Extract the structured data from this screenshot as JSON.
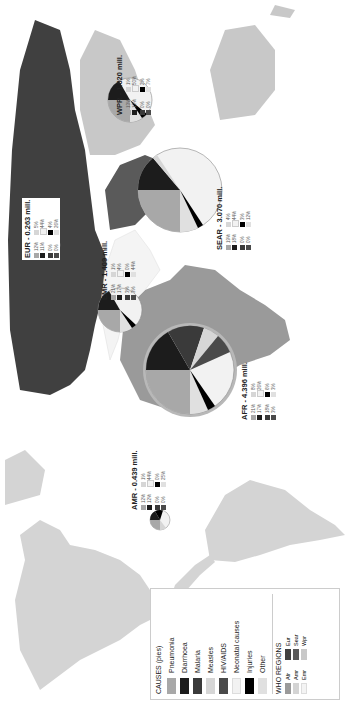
{
  "map": {
    "title": "WHO regions - causes of child deaths (pies)",
    "caption": "Distribution of deaths among children under five by cause and WHO region"
  },
  "colors": {
    "pneumonia": "#a8a8a8",
    "diarrhoea": "#1c1c1c",
    "malaria": "#3a3a3a",
    "measles": "#d6d6d6",
    "hiv_aids": "#4a4a4a",
    "neonatal": "#f2f2f2",
    "injuries": "#000000",
    "other": "#e0e0e0",
    "region_afr": "#9a9a9a",
    "region_amr": "#d4d4d4",
    "region_emr": "#f4f4f4",
    "region_eur": "#404040",
    "region_sear": "#5a5a5a",
    "region_wpr": "#c8c8c8"
  },
  "legend": {
    "causes_title": "CAUSES (pies)",
    "causes": [
      {
        "label": "Pneumonia",
        "key": "pneumonia"
      },
      {
        "label": "Diarrhoea",
        "key": "diarrhoea"
      },
      {
        "label": "Malaria",
        "key": "malaria"
      },
      {
        "label": "Measles",
        "key": "measles"
      },
      {
        "label": "HIV/AIDS",
        "key": "hiv_aids"
      },
      {
        "label": "Neonatal causes",
        "key": "neonatal"
      },
      {
        "label": "Injuries",
        "key": "injuries"
      },
      {
        "label": "Other",
        "key": "other"
      }
    ],
    "regions_title": "WHO REGIONS",
    "regions": [
      {
        "label": "Afr",
        "key": "region_afr"
      },
      {
        "label": "Eur",
        "key": "region_eur"
      },
      {
        "label": "Amr",
        "key": "region_amr"
      },
      {
        "label": "Sear",
        "key": "region_sear"
      },
      {
        "label": "Emr",
        "key": "region_emr"
      },
      {
        "label": "Wpr",
        "key": "region_wpr"
      }
    ]
  },
  "regions": [
    {
      "id": "amr",
      "label": "AMR - 0.439 mill.",
      "pcts": [
        "12%",
        "1%",
        "12%",
        "44%",
        "0%",
        "0%",
        "0%",
        "25%"
      ]
    },
    {
      "id": "afr",
      "label": "AFR - 4.396 mill.",
      "pcts": [
        "21%",
        "8%",
        "17%",
        "26%",
        "18%",
        "6%",
        "3%",
        "3%"
      ]
    },
    {
      "id": "emr",
      "label": "EMR - 1.409 mill.",
      "pcts": [
        "21%",
        "1%",
        "17%",
        "4%",
        "3%",
        "0%",
        "3%",
        "44%"
      ]
    },
    {
      "id": "eur",
      "label": "EUR - 0.263 mill.",
      "pcts": [
        "12%",
        "5%",
        "11%",
        "44%",
        "0%",
        "4%",
        "0%",
        "26%"
      ]
    },
    {
      "id": "sear",
      "label": "SEAR - 3.070 mill.",
      "pcts": [
        "19%",
        "4%",
        "18%",
        "44%",
        "0%",
        "3%",
        "0%",
        "12%"
      ]
    },
    {
      "id": "wpr",
      "label": "WPR - 1.020 mill.",
      "pcts": [
        "13%",
        "1%",
        "12%",
        "50%",
        "0%",
        "2%",
        "0%",
        "7%"
      ]
    }
  ]
}
